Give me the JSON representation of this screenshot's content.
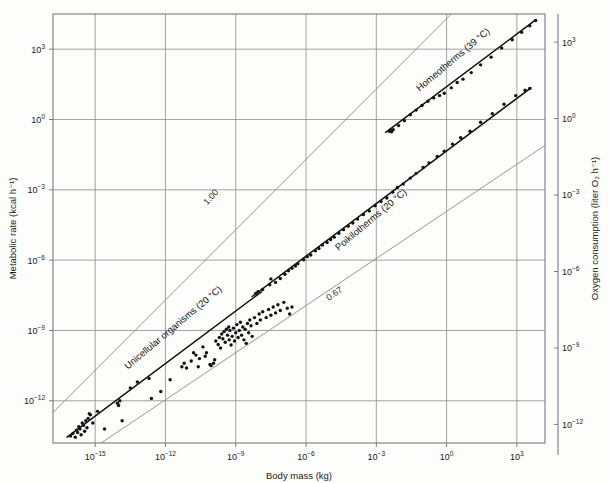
{
  "chart_data": {
    "type": "scatter",
    "title": "",
    "xlabel": "Body mass (kg)",
    "ylabel": "Metabolic rate (kcal h⁻¹)",
    "y2label": "Oxygen consumption (liter O₂ h⁻¹)",
    "xscale": "log10",
    "yscale": "log10",
    "grid": true,
    "legend": "inline-annotations",
    "xlim": [
      -16.8,
      4.2
    ],
    "ylim": [
      -13.8,
      4.5
    ],
    "y2lim": [
      -13.2,
      4.1
    ],
    "xticks": [
      {
        "value": -15,
        "label_mantissa": "10",
        "label_exp": "−15"
      },
      {
        "value": -12,
        "label_mantissa": "10",
        "label_exp": "−12"
      },
      {
        "value": -9,
        "label_mantissa": "10",
        "label_exp": "−9"
      },
      {
        "value": -6,
        "label_mantissa": "10",
        "label_exp": "−6"
      },
      {
        "value": -3,
        "label_mantissa": "10",
        "label_exp": "−3"
      },
      {
        "value": 0,
        "label_mantissa": "10",
        "label_exp": "0"
      },
      {
        "value": 3,
        "label_mantissa": "10",
        "label_exp": "3"
      }
    ],
    "yticks": [
      {
        "value": 3,
        "label_mantissa": "10",
        "label_exp": "3"
      },
      {
        "value": 0,
        "label_mantissa": "10",
        "label_exp": "0"
      },
      {
        "value": -3,
        "label_mantissa": "10",
        "label_exp": "−3"
      },
      {
        "value": -6,
        "label_mantissa": "10",
        "label_exp": "−6"
      },
      {
        "value": -9,
        "label_mantissa": "10",
        "label_exp": "−9"
      },
      {
        "value": -12,
        "label_mantissa": "10",
        "label_exp": "−12"
      }
    ],
    "y2ticks": [
      {
        "value": 3,
        "label_mantissa": "10",
        "label_exp": "3"
      },
      {
        "value": 0,
        "label_mantissa": "10",
        "label_exp": "0"
      },
      {
        "value": -3,
        "label_mantissa": "10",
        "label_exp": "−3"
      },
      {
        "value": -6,
        "label_mantissa": "10",
        "label_exp": "−6"
      },
      {
        "value": -9,
        "label_mantissa": "10",
        "label_exp": "−9"
      },
      {
        "value": -12,
        "label_mantissa": "10",
        "label_exp": "−12"
      }
    ],
    "annotations": [
      {
        "name": "homeotherms",
        "text": "Homeotherms (39 °C)",
        "x_px": 455,
        "y_px": 62,
        "rotation": -40
      },
      {
        "name": "poikilotherms",
        "text": "Poikilotherms (20 °C)",
        "x_px": 373,
        "y_px": 222,
        "rotation": -40
      },
      {
        "name": "unicellular",
        "text": "Unicellular organisms (20 °C)",
        "x_px": 175,
        "y_px": 330,
        "rotation": -40
      },
      {
        "name": "slope-1.00",
        "text": "1.00",
        "x_px": 213,
        "y_px": 199,
        "rotation": -48
      },
      {
        "name": "slope-0.67",
        "text": "0.67",
        "x_px": 336,
        "y_px": 296,
        "rotation": -34
      }
    ],
    "reference_lines": [
      {
        "name": "slope-1.00-line",
        "slope": 1.0,
        "x0": -16.3,
        "y0": -12.0,
        "label": "1.00"
      },
      {
        "name": "slope-0.67-line",
        "slope": 0.67,
        "x0": -14.6,
        "y0": -13.7,
        "label": "0.67"
      }
    ],
    "series": [
      {
        "name": "Homeotherms (39 °C)",
        "temperature_C": 39,
        "fit_slope": 0.75,
        "fit_x": [
          -2.6,
          3.8
        ],
        "fit_y": [
          -0.55,
          4.25
        ],
        "points": [
          [
            -2.45,
            -0.5
          ],
          [
            -2.4,
            -0.46
          ],
          [
            -2.35,
            -0.52
          ],
          [
            -2.28,
            -0.44
          ],
          [
            -2.05,
            -0.26
          ],
          [
            -1.8,
            -0.05
          ],
          [
            -1.55,
            0.2
          ],
          [
            -1.3,
            0.4
          ],
          [
            -1.05,
            0.6
          ],
          [
            -0.8,
            0.78
          ],
          [
            -0.55,
            0.92
          ],
          [
            -0.3,
            1.02
          ],
          [
            -0.1,
            1.12
          ],
          [
            0.2,
            1.35
          ],
          [
            0.45,
            1.58
          ],
          [
            0.7,
            1.72
          ],
          [
            1.05,
            2.0
          ],
          [
            1.45,
            2.33
          ],
          [
            1.9,
            2.66
          ],
          [
            2.35,
            3.05
          ],
          [
            2.8,
            3.4
          ],
          [
            3.2,
            3.72
          ],
          [
            3.55,
            4.0
          ],
          [
            3.8,
            4.22
          ]
        ]
      },
      {
        "name": "Poikilotherms (20 °C)",
        "temperature_C": 20,
        "fit_slope": 0.75,
        "fit_x": [
          -8.3,
          3.6
        ],
        "fit_y": [
          -7.55,
          1.35
        ],
        "points": [
          [
            -8.15,
            -7.42
          ],
          [
            -8.05,
            -7.35
          ],
          [
            -7.85,
            -7.25
          ],
          [
            -7.55,
            -7.05
          ],
          [
            -7.5,
            -6.8
          ],
          [
            -7.3,
            -6.95
          ],
          [
            -7.1,
            -6.78
          ],
          [
            -6.9,
            -6.6
          ],
          [
            -6.75,
            -6.45
          ],
          [
            -6.6,
            -6.35
          ],
          [
            -6.45,
            -6.25
          ],
          [
            -6.35,
            -6.15
          ],
          [
            -6.1,
            -5.98
          ],
          [
            -5.95,
            -5.85
          ],
          [
            -5.8,
            -5.78
          ],
          [
            -5.6,
            -5.6
          ],
          [
            -5.45,
            -5.5
          ],
          [
            -5.3,
            -5.35
          ],
          [
            -5.1,
            -5.25
          ],
          [
            -4.95,
            -5.12
          ],
          [
            -4.8,
            -5.02
          ],
          [
            -4.6,
            -4.85
          ],
          [
            -4.4,
            -4.7
          ],
          [
            -4.2,
            -4.55
          ],
          [
            -4.0,
            -4.42
          ],
          [
            -3.8,
            -4.25
          ],
          [
            -3.55,
            -4.05
          ],
          [
            -3.3,
            -3.9
          ],
          [
            -3.05,
            -3.68
          ],
          [
            -2.8,
            -3.5
          ],
          [
            -2.55,
            -3.35
          ],
          [
            -2.3,
            -3.1
          ],
          [
            -2.1,
            -2.9
          ],
          [
            -1.85,
            -2.75
          ],
          [
            -1.55,
            -2.5
          ],
          [
            -1.3,
            -2.3
          ],
          [
            -1.0,
            -2.05
          ],
          [
            -0.75,
            -1.85
          ],
          [
            -0.4,
            -1.58
          ],
          [
            -0.1,
            -1.35
          ],
          [
            0.25,
            -1.05
          ],
          [
            0.6,
            -0.78
          ],
          [
            1.0,
            -0.5
          ],
          [
            1.45,
            -0.12
          ],
          [
            1.95,
            0.25
          ],
          [
            2.45,
            0.65
          ],
          [
            2.95,
            1.02
          ],
          [
            3.35,
            1.25
          ],
          [
            3.55,
            1.32
          ]
        ]
      },
      {
        "name": "Unicellular organisms (20 °C)",
        "temperature_C": 20,
        "fit_slope": 0.75,
        "fit_x": [
          -16.2,
          -7.9
        ],
        "fit_y": [
          -13.55,
          -7.35
        ],
        "points": [
          [
            -16.05,
            -13.5
          ],
          [
            -15.95,
            -13.4
          ],
          [
            -15.85,
            -13.55
          ],
          [
            -15.8,
            -13.25
          ],
          [
            -15.75,
            -13.35
          ],
          [
            -15.7,
            -13.1
          ],
          [
            -15.65,
            -13.2
          ],
          [
            -15.6,
            -13.45
          ],
          [
            -15.55,
            -12.95
          ],
          [
            -15.5,
            -13.05
          ],
          [
            -15.45,
            -13.3
          ],
          [
            -15.4,
            -12.85
          ],
          [
            -15.35,
            -13.15
          ],
          [
            -15.3,
            -12.75
          ],
          [
            -15.25,
            -12.55
          ],
          [
            -15.2,
            -12.6
          ],
          [
            -15.1,
            -12.95
          ],
          [
            -14.9,
            -12.45
          ],
          [
            -14.6,
            -13.2
          ],
          [
            -14.05,
            -12.1
          ],
          [
            -14.0,
            -12.2
          ],
          [
            -13.95,
            -12.0
          ],
          [
            -13.85,
            -12.85
          ],
          [
            -13.5,
            -11.45
          ],
          [
            -13.2,
            -11.2
          ],
          [
            -12.7,
            -11.05
          ],
          [
            -11.8,
            -11.1
          ],
          [
            -11.3,
            -10.55
          ],
          [
            -11.2,
            -10.4
          ],
          [
            -11.1,
            -10.6
          ],
          [
            -10.9,
            -10.3
          ],
          [
            -10.7,
            -10.05
          ],
          [
            -10.55,
            -10.2
          ],
          [
            -10.4,
            -9.7
          ],
          [
            -10.25,
            -9.95
          ],
          [
            -10.1,
            -10.45
          ],
          [
            -10.05,
            -10.5
          ],
          [
            -9.95,
            -10.4
          ],
          [
            -9.85,
            -9.45
          ],
          [
            -9.75,
            -9.6
          ],
          [
            -9.7,
            -9.3
          ],
          [
            -9.65,
            -9.75
          ],
          [
            -9.6,
            -9.15
          ],
          [
            -9.55,
            -9.35
          ],
          [
            -9.5,
            -9.05
          ],
          [
            -9.45,
            -9.5
          ],
          [
            -9.4,
            -8.95
          ],
          [
            -9.35,
            -9.2
          ],
          [
            -9.3,
            -8.85
          ],
          [
            -9.28,
            -9.4
          ],
          [
            -9.25,
            -9.0
          ],
          [
            -9.2,
            -9.62
          ],
          [
            -9.15,
            -9.25
          ],
          [
            -9.1,
            -8.9
          ],
          [
            -9.05,
            -9.45
          ],
          [
            -9.0,
            -9.1
          ],
          [
            -8.95,
            -8.75
          ],
          [
            -8.9,
            -9.3
          ],
          [
            -8.85,
            -9.0
          ],
          [
            -8.8,
            -8.65
          ],
          [
            -8.75,
            -9.2
          ],
          [
            -8.7,
            -8.85
          ],
          [
            -8.65,
            -9.4
          ],
          [
            -8.6,
            -8.95
          ],
          [
            -8.55,
            -9.55
          ],
          [
            -8.5,
            -8.7
          ],
          [
            -8.45,
            -9.1
          ],
          [
            -8.4,
            -8.55
          ],
          [
            -8.35,
            -8.8
          ],
          [
            -8.3,
            -9.25
          ],
          [
            -8.2,
            -8.45
          ],
          [
            -8.1,
            -8.7
          ],
          [
            -8.0,
            -8.3
          ],
          [
            -7.95,
            -8.55
          ],
          [
            -7.85,
            -8.2
          ],
          [
            -7.7,
            -8.45
          ],
          [
            -7.6,
            -8.1
          ],
          [
            -7.5,
            -8.35
          ],
          [
            -7.4,
            -8.0
          ],
          [
            -7.3,
            -8.25
          ],
          [
            -7.2,
            -7.9
          ],
          [
            -7.1,
            -8.15
          ],
          [
            -6.95,
            -7.8
          ],
          [
            -6.8,
            -8.05
          ],
          [
            -6.7,
            -8.3
          ],
          [
            -6.6,
            -8.0
          ],
          [
            -10.8,
            -9.95
          ],
          [
            -10.6,
            -10.55
          ],
          [
            -10.3,
            -10.1
          ],
          [
            -9.9,
            -10.25
          ],
          [
            -12.2,
            -11.6
          ],
          [
            -12.6,
            -11.9
          ]
        ]
      }
    ]
  },
  "plot_frame": {
    "left_px": 53,
    "right_px": 545,
    "top_px": 14,
    "bottom_px": 443,
    "right_axis_x_px": 558,
    "right_axis_top_px": 14,
    "right_axis_bottom_px": 455
  },
  "colors": {
    "background": "#fdfdfc",
    "grid": "#8a8a8a",
    "frame": "#7a7a7a",
    "data": "#111111",
    "fit_line": "#111111",
    "reference_line": "#8a8a8a",
    "text": "#1a1a1a"
  }
}
